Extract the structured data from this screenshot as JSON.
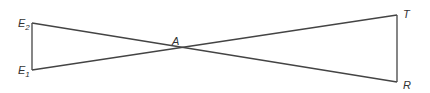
{
  "diagram": {
    "type": "geometry",
    "points": {
      "E2": {
        "label": "E",
        "subscript": "2",
        "x": 32,
        "y": 23
      },
      "E1": {
        "label": "E",
        "subscript": "1",
        "x": 32,
        "y": 70
      },
      "A": {
        "label": "A",
        "x": 174,
        "y": 48
      },
      "T": {
        "label": "T",
        "x": 397,
        "y": 15
      },
      "R": {
        "label": "R",
        "x": 397,
        "y": 82
      }
    },
    "segments": [
      [
        "E2",
        "E1"
      ],
      [
        "E2",
        "R"
      ],
      [
        "E1",
        "T"
      ],
      [
        "T",
        "R"
      ]
    ],
    "colors": {
      "line": "#444444",
      "text": "#333333",
      "background": "#ffffff"
    }
  }
}
